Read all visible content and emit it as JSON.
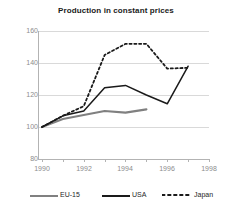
{
  "chart_data": {
    "type": "line",
    "title": "Production in constant prices",
    "xlabel": "",
    "ylabel": "",
    "xlim": [
      1990,
      1998
    ],
    "ylim": [
      80,
      160
    ],
    "grid": true,
    "legend_position": "bottom",
    "x_ticks": [
      "1990",
      "1992",
      "1994",
      "1996",
      "1998"
    ],
    "y_ticks": [
      "80",
      "100",
      "120",
      "140",
      "160"
    ],
    "series": [
      {
        "name": "EU-15",
        "color": "#808080",
        "style": "solid-thick",
        "x": [
          1990,
          1991,
          1992,
          1993,
          1994,
          1995
        ],
        "values": [
          100,
          105,
          107.5,
          110,
          109,
          111
        ]
      },
      {
        "name": "USA",
        "color": "#1a1a1a",
        "style": "solid",
        "x": [
          1990,
          1991,
          1992,
          1993,
          1994,
          1995,
          1996,
          1997
        ],
        "values": [
          100,
          107,
          110,
          124.5,
          126,
          120,
          114.5,
          138
        ]
      },
      {
        "name": "Japan",
        "color": "#1a1a1a",
        "style": "dashed",
        "x": [
          1990,
          1991,
          1992,
          1993,
          1994,
          1995,
          1996,
          1997
        ],
        "values": [
          100,
          107,
          113,
          145,
          152,
          152,
          136.5,
          137
        ]
      }
    ]
  },
  "axis": {
    "y_labels": [
      "160",
      "140",
      "120",
      "100",
      "80"
    ],
    "x_labels": [
      "1990",
      "1992",
      "1994",
      "1996",
      "1998"
    ]
  },
  "legend": {
    "items": [
      {
        "label": "EU-15"
      },
      {
        "label": "USA"
      },
      {
        "label": "Japan"
      }
    ]
  }
}
